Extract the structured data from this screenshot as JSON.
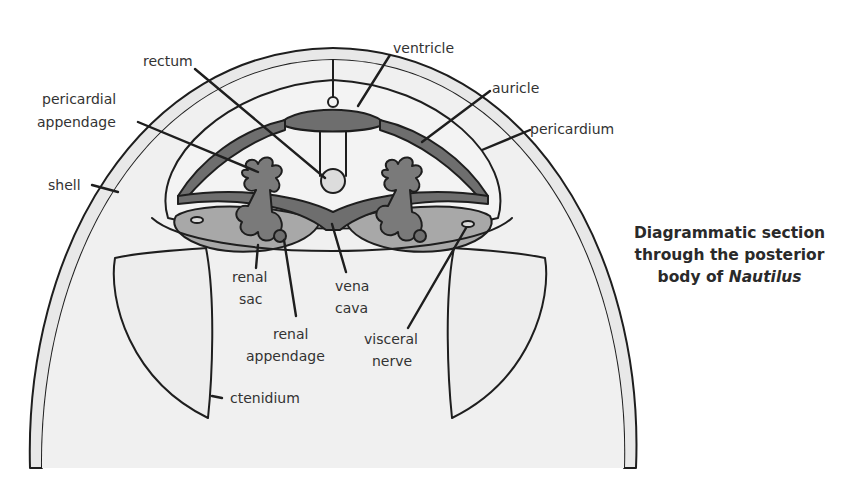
{
  "figure": {
    "caption": {
      "line1": "Diagrammatic section",
      "line2": "through the posterior",
      "line3_prefix": "body of ",
      "line3_italic": "Nautilus"
    },
    "labels": {
      "rectum": "rectum",
      "ventricle": "ventricle",
      "auricle": "auricle",
      "pericardium": "pericardium",
      "pericardial_appendage_1": "pericardial",
      "pericardial_appendage_2": "appendage",
      "shell": "shell",
      "renal_sac_1": "renal",
      "renal_sac_2": "sac",
      "vena_cava_1": "vena",
      "vena_cava_2": "cava",
      "renal_appendage_1": "renal",
      "renal_appendage_2": "appendage",
      "visceral_nerve_1": "visceral",
      "visceral_nerve_2": "nerve",
      "ctenidium": "ctenidium"
    },
    "colors": {
      "background": "#ffffff",
      "outline": "#1e1e1e",
      "light_fill": "#ededed",
      "mid_fill": "#a8a8a8",
      "dark_fill": "#6e6e6e",
      "label_text": "#333333"
    }
  }
}
